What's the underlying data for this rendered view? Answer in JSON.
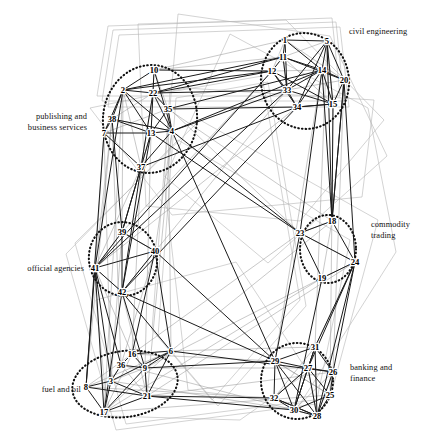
{
  "figure": {
    "type": "network-graph",
    "title": "",
    "node_count": 42,
    "cluster_count": 6,
    "colors": {
      "edge_dark": "#1a1a1a",
      "edge_light": "#9a9a9a",
      "hull": "#b5b5b5",
      "cluster_ring": "#111111",
      "node_label": "#000000",
      "background": "#ffffff"
    }
  },
  "clusters": [
    {
      "id": "civil-engineering",
      "label": "civil engineering",
      "label_x": 349,
      "label_y": 27,
      "side": "r",
      "cx": 305,
      "cy": 81,
      "rx": 44,
      "ry": 48,
      "rot": -8,
      "members": [
        1,
        5,
        11,
        12,
        14,
        20,
        33,
        34,
        15
      ]
    },
    {
      "id": "publishing-business-services",
      "label": "publishing and\nbusiness services",
      "label_x": 87,
      "label_y": 112,
      "side": "l",
      "cx": 150,
      "cy": 119,
      "rx": 47,
      "ry": 54,
      "rot": 6,
      "members": [
        10,
        2,
        22,
        35,
        38,
        7,
        13,
        4,
        37
      ]
    },
    {
      "id": "commodity-trading",
      "label": "commodity\ntrading",
      "label_x": 371,
      "label_y": 220,
      "side": "r",
      "cx": 328,
      "cy": 249,
      "rx": 28,
      "ry": 34,
      "rot": 0,
      "members": [
        18,
        23,
        24,
        19
      ]
    },
    {
      "id": "official-agencies",
      "label": "official agencies",
      "label_x": 84,
      "label_y": 264,
      "side": "l",
      "cx": 123,
      "cy": 259,
      "rx": 34,
      "ry": 37,
      "rot": -12,
      "members": [
        39,
        40,
        41,
        42
      ]
    },
    {
      "id": "banking-finance",
      "label": "banking and\nfinance",
      "label_x": 350,
      "label_y": 363,
      "side": "r",
      "cx": 297,
      "cy": 381,
      "rx": 36,
      "ry": 38,
      "rot": 0,
      "members": [
        29,
        31,
        27,
        26,
        25,
        32,
        30,
        28
      ]
    },
    {
      "id": "fuel-and-oil",
      "label": "fuel and oil",
      "label_x": 81,
      "label_y": 385,
      "side": "l",
      "cx": 125,
      "cy": 384,
      "rx": 53,
      "ry": 33,
      "rot": -8,
      "members": [
        16,
        36,
        6,
        9,
        3,
        8,
        21,
        17
      ]
    }
  ],
  "nodes": [
    {
      "id": 1,
      "label": "1",
      "x": 285,
      "y": 43
    },
    {
      "id": 5,
      "label": "5",
      "x": 327,
      "y": 44
    },
    {
      "id": 11,
      "label": "11",
      "x": 283,
      "y": 60
    },
    {
      "id": 12,
      "label": "12",
      "x": 272,
      "y": 74
    },
    {
      "id": 14,
      "label": "14",
      "x": 322,
      "y": 73
    },
    {
      "id": 20,
      "label": "20",
      "x": 344,
      "y": 83
    },
    {
      "id": 33,
      "label": "33",
      "x": 287,
      "y": 93
    },
    {
      "id": 34,
      "label": "34",
      "x": 297,
      "y": 110
    },
    {
      "id": 15,
      "label": "15",
      "x": 333,
      "y": 107
    },
    {
      "id": 10,
      "label": "10",
      "x": 154,
      "y": 73
    },
    {
      "id": 2,
      "label": "2",
      "x": 123,
      "y": 93
    },
    {
      "id": 22,
      "label": "22",
      "x": 153,
      "y": 96
    },
    {
      "id": 35,
      "label": "35",
      "x": 168,
      "y": 112
    },
    {
      "id": 38,
      "label": "38",
      "x": 112,
      "y": 122
    },
    {
      "id": 7,
      "label": "7",
      "x": 104,
      "y": 136
    },
    {
      "id": 13,
      "label": "13",
      "x": 151,
      "y": 136
    },
    {
      "id": 4,
      "label": "4",
      "x": 172,
      "y": 134
    },
    {
      "id": 37,
      "label": "37",
      "x": 141,
      "y": 170
    },
    {
      "id": 18,
      "label": "18",
      "x": 332,
      "y": 224
    },
    {
      "id": 23,
      "label": "23",
      "x": 300,
      "y": 236
    },
    {
      "id": 24,
      "label": "24",
      "x": 355,
      "y": 265
    },
    {
      "id": 19,
      "label": "19",
      "x": 322,
      "y": 281
    },
    {
      "id": 39,
      "label": "39",
      "x": 122,
      "y": 235
    },
    {
      "id": 40,
      "label": "40",
      "x": 155,
      "y": 254
    },
    {
      "id": 41,
      "label": "41",
      "x": 95,
      "y": 271
    },
    {
      "id": 42,
      "label": "42",
      "x": 122,
      "y": 295
    },
    {
      "id": 29,
      "label": "29",
      "x": 275,
      "y": 364
    },
    {
      "id": 31,
      "label": "31",
      "x": 315,
      "y": 350
    },
    {
      "id": 27,
      "label": "27",
      "x": 308,
      "y": 371
    },
    {
      "id": 26,
      "label": "26",
      "x": 333,
      "y": 375
    },
    {
      "id": 25,
      "label": "25",
      "x": 330,
      "y": 398
    },
    {
      "id": 32,
      "label": "32",
      "x": 274,
      "y": 401
    },
    {
      "id": 30,
      "label": "30",
      "x": 294,
      "y": 413
    },
    {
      "id": 28,
      "label": "28",
      "x": 317,
      "y": 419
    },
    {
      "id": 16,
      "label": "16",
      "x": 132,
      "y": 357
    },
    {
      "id": 36,
      "label": "36",
      "x": 121,
      "y": 368
    },
    {
      "id": 6,
      "label": "6",
      "x": 171,
      "y": 354
    },
    {
      "id": 9,
      "label": "9",
      "x": 145,
      "y": 371
    },
    {
      "id": 3,
      "label": "3",
      "x": 111,
      "y": 384
    },
    {
      "id": 8,
      "label": "8",
      "x": 86,
      "y": 390
    },
    {
      "id": 21,
      "label": "21",
      "x": 147,
      "y": 399
    },
    {
      "id": 17,
      "label": "17",
      "x": 104,
      "y": 415
    }
  ],
  "edges_dark": [
    [
      1,
      11
    ],
    [
      1,
      14
    ],
    [
      1,
      33
    ],
    [
      1,
      5
    ],
    [
      5,
      14
    ],
    [
      5,
      20
    ],
    [
      5,
      33
    ],
    [
      5,
      34
    ],
    [
      5,
      15
    ],
    [
      11,
      12
    ],
    [
      11,
      14
    ],
    [
      11,
      33
    ],
    [
      12,
      33
    ],
    [
      12,
      34
    ],
    [
      14,
      20
    ],
    [
      14,
      33
    ],
    [
      14,
      34
    ],
    [
      14,
      15
    ],
    [
      33,
      34
    ],
    [
      33,
      15
    ],
    [
      34,
      15
    ],
    [
      20,
      15
    ],
    [
      12,
      15
    ],
    [
      11,
      20
    ],
    [
      10,
      22
    ],
    [
      10,
      4
    ],
    [
      10,
      2
    ],
    [
      2,
      22
    ],
    [
      2,
      38
    ],
    [
      2,
      7
    ],
    [
      2,
      13
    ],
    [
      2,
      4
    ],
    [
      22,
      35
    ],
    [
      22,
      4
    ],
    [
      22,
      13
    ],
    [
      35,
      4
    ],
    [
      38,
      7
    ],
    [
      38,
      13
    ],
    [
      38,
      4
    ],
    [
      7,
      13
    ],
    [
      13,
      4
    ],
    [
      13,
      37
    ],
    [
      37,
      4
    ],
    [
      37,
      7
    ],
    [
      37,
      22
    ],
    [
      35,
      13
    ],
    [
      18,
      23
    ],
    [
      18,
      24
    ],
    [
      23,
      19
    ],
    [
      23,
      24
    ],
    [
      19,
      24
    ],
    [
      39,
      41
    ],
    [
      39,
      42
    ],
    [
      39,
      40
    ],
    [
      40,
      41
    ],
    [
      41,
      42
    ],
    [
      40,
      42
    ],
    [
      29,
      27
    ],
    [
      29,
      31
    ],
    [
      29,
      32
    ],
    [
      29,
      30
    ],
    [
      29,
      28
    ],
    [
      31,
      27
    ],
    [
      31,
      30
    ],
    [
      31,
      28
    ],
    [
      27,
      26
    ],
    [
      27,
      30
    ],
    [
      27,
      28
    ],
    [
      27,
      32
    ],
    [
      26,
      25
    ],
    [
      26,
      28
    ],
    [
      25,
      30
    ],
    [
      25,
      28
    ],
    [
      32,
      30
    ],
    [
      30,
      28
    ],
    [
      32,
      28
    ],
    [
      16,
      36
    ],
    [
      16,
      6
    ],
    [
      16,
      9
    ],
    [
      36,
      3
    ],
    [
      36,
      9
    ],
    [
      6,
      9
    ],
    [
      6,
      21
    ],
    [
      6,
      3
    ],
    [
      3,
      8
    ],
    [
      3,
      17
    ],
    [
      3,
      21
    ],
    [
      8,
      17
    ],
    [
      8,
      21
    ],
    [
      9,
      21
    ],
    [
      17,
      21
    ],
    [
      9,
      17
    ],
    [
      4,
      14
    ],
    [
      4,
      33
    ],
    [
      22,
      12
    ],
    [
      22,
      11
    ],
    [
      35,
      14
    ],
    [
      13,
      23
    ],
    [
      4,
      29
    ],
    [
      37,
      42
    ],
    [
      37,
      39
    ],
    [
      41,
      3
    ],
    [
      41,
      17
    ],
    [
      42,
      9
    ],
    [
      42,
      6
    ],
    [
      40,
      29
    ],
    [
      24,
      31
    ],
    [
      24,
      27
    ],
    [
      23,
      29
    ],
    [
      18,
      14
    ],
    [
      18,
      20
    ],
    [
      19,
      30
    ],
    [
      34,
      42
    ],
    [
      33,
      41
    ],
    [
      2,
      41
    ],
    [
      7,
      8
    ],
    [
      38,
      39
    ],
    [
      12,
      2
    ],
    [
      5,
      18
    ],
    [
      20,
      24
    ],
    [
      14,
      23
    ],
    [
      15,
      18
    ],
    [
      6,
      26
    ],
    [
      9,
      29
    ],
    [
      21,
      32
    ],
    [
      16,
      40
    ],
    [
      36,
      41
    ],
    [
      22,
      33
    ],
    [
      4,
      23
    ],
    [
      13,
      42
    ],
    [
      10,
      12
    ],
    [
      35,
      34
    ],
    [
      29,
      42
    ],
    [
      26,
      24
    ],
    [
      30,
      21
    ],
    [
      28,
      32
    ],
    [
      31,
      26
    ],
    [
      27,
      25
    ],
    [
      17,
      42
    ],
    [
      8,
      41
    ],
    [
      40,
      6
    ],
    [
      39,
      37
    ],
    [
      12,
      41
    ],
    [
      34,
      37
    ],
    [
      11,
      2
    ],
    [
      20,
      18
    ],
    [
      15,
      34
    ],
    [
      24,
      28
    ]
  ],
  "edges_light": [
    [
      10,
      1
    ],
    [
      10,
      11
    ],
    [
      2,
      39
    ],
    [
      38,
      41
    ],
    [
      7,
      41
    ],
    [
      37,
      41
    ],
    [
      13,
      39
    ],
    [
      4,
      40
    ],
    [
      35,
      18
    ],
    [
      22,
      23
    ],
    [
      12,
      39
    ],
    [
      33,
      42
    ],
    [
      34,
      41
    ],
    [
      14,
      29
    ],
    [
      5,
      31
    ],
    [
      20,
      26
    ],
    [
      15,
      25
    ],
    [
      18,
      6
    ],
    [
      23,
      16
    ],
    [
      24,
      21
    ],
    [
      19,
      17
    ],
    [
      19,
      9
    ],
    [
      39,
      3
    ],
    [
      40,
      36
    ],
    [
      41,
      16
    ],
    [
      42,
      21
    ],
    [
      29,
      16
    ],
    [
      31,
      6
    ],
    [
      27,
      9
    ],
    [
      26,
      21
    ],
    [
      25,
      17
    ],
    [
      32,
      8
    ],
    [
      30,
      3
    ],
    [
      28,
      36
    ],
    [
      16,
      37
    ],
    [
      36,
      38
    ],
    [
      6,
      35
    ],
    [
      9,
      13
    ],
    [
      3,
      7
    ],
    [
      8,
      38
    ],
    [
      21,
      4
    ],
    [
      17,
      2
    ],
    [
      1,
      20
    ],
    [
      5,
      11
    ],
    [
      14,
      12
    ],
    [
      33,
      11
    ],
    [
      34,
      33
    ],
    [
      15,
      14
    ],
    [
      18,
      19
    ],
    [
      23,
      24
    ],
    [
      40,
      39
    ],
    [
      42,
      41
    ],
    [
      31,
      32
    ],
    [
      27,
      28
    ],
    [
      26,
      30
    ],
    [
      25,
      29
    ],
    [
      16,
      17
    ],
    [
      36,
      21
    ],
    [
      6,
      8
    ],
    [
      9,
      3
    ],
    [
      22,
      37
    ],
    [
      35,
      7
    ],
    [
      4,
      38
    ],
    [
      13,
      10
    ],
    [
      2,
      37
    ],
    [
      12,
      34
    ],
    [
      11,
      15
    ],
    [
      20,
      14
    ],
    [
      1,
      12
    ],
    [
      5,
      15
    ],
    [
      33,
      20
    ],
    [
      18,
      23
    ],
    [
      24,
      19
    ],
    [
      39,
      40
    ],
    [
      41,
      39
    ],
    [
      29,
      25
    ],
    [
      31,
      24
    ],
    [
      32,
      27
    ],
    [
      30,
      31
    ],
    [
      28,
      26
    ],
    [
      3,
      36
    ],
    [
      8,
      16
    ],
    [
      21,
      9
    ],
    [
      17,
      6
    ],
    [
      37,
      13
    ],
    [
      7,
      2
    ],
    [
      38,
      22
    ],
    [
      35,
      10
    ]
  ],
  "hulls": [
    {
      "points": "97,96 108,26 332,18 340,96"
    },
    {
      "points": "102,101 113,30 336,22 344,101"
    },
    {
      "points": "108,107 119,35 340,27 349,107"
    },
    {
      "points": "90,108 186,88 374,100 362,197 172,215"
    },
    {
      "points": "138,24 286,20 384,120 300,221 146,206"
    },
    {
      "points": "178,14 330,36 387,156 268,263 164,176"
    },
    {
      "points": "75,243 200,120 378,220 330,398 126,424"
    },
    {
      "points": "66,254 178,140 350,240 316,404 116,430"
    },
    {
      "points": "170,92 262,76 300,300 212,400 152,330"
    },
    {
      "points": "176,98 268,82 306,306 218,406 158,336"
    },
    {
      "points": "96,300 236,262 308,372 240,420 108,416"
    },
    {
      "points": "230,34 368,108 396,252 300,404 188,390 164,180"
    }
  ]
}
